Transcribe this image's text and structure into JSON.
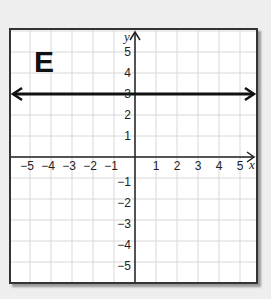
{
  "panel_label": "E",
  "axes": {
    "x_label": "x",
    "y_label": "y",
    "x_ticks": [
      "-5",
      "-4",
      "-3",
      "-2",
      "-1",
      "1",
      "2",
      "3",
      "4",
      "5"
    ],
    "y_ticks": [
      "5",
      "4",
      "3",
      "2",
      "1",
      "-1",
      "-2",
      "-3",
      "-4",
      "-5"
    ]
  },
  "colors": {
    "grid": "#d8d8d8",
    "axis": "#222222",
    "line": "#111111",
    "frame": "#333333"
  },
  "chart_data": {
    "type": "line",
    "title": "E",
    "xlabel": "x",
    "ylabel": "y",
    "xlim": [
      -6,
      6
    ],
    "ylim": [
      -6,
      6
    ],
    "grid": true,
    "x_tick_labels": [
      "-5",
      "-4",
      "-3",
      "-2",
      "-1",
      "1",
      "2",
      "3",
      "4",
      "5"
    ],
    "y_tick_labels": [
      "-5",
      "-4",
      "-3",
      "-2",
      "-1",
      "1",
      "2",
      "3",
      "4",
      "5"
    ],
    "series": [
      {
        "name": "y = 3",
        "equation": "y = 3",
        "x": [
          -6,
          6
        ],
        "y": [
          3,
          3
        ],
        "arrows": "both ends"
      }
    ]
  }
}
